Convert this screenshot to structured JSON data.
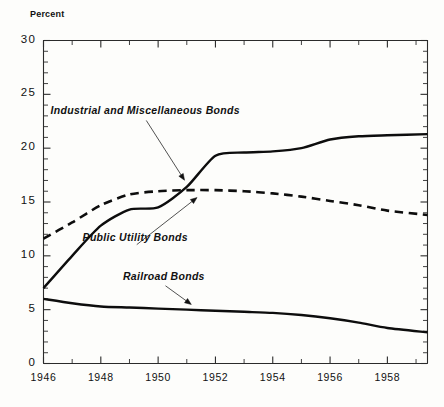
{
  "chart_data": {
    "type": "line",
    "title": "",
    "xlabel": "",
    "ylabel": "Percent",
    "ylim": [
      0,
      30
    ],
    "xlim": [
      1946,
      1959.4
    ],
    "grid": false,
    "legend_position": "inline-annotations",
    "ytick_labels": [
      "0",
      "5",
      "10",
      "15",
      "20",
      "25",
      "30"
    ],
    "ytick_values": [
      0,
      5,
      10,
      15,
      20,
      25,
      30
    ],
    "yminor_step": 1,
    "xtick_labels": [
      "1946",
      "1948",
      "1950",
      "1952",
      "1954",
      "1956",
      "1958"
    ],
    "xtick_values": [
      1946,
      1948,
      1950,
      1952,
      1954,
      1956,
      1958
    ],
    "xminor_step": 1,
    "x": [
      1946,
      1947,
      1948,
      1949,
      1950,
      1951,
      1952,
      1953,
      1954,
      1955,
      1956,
      1957,
      1958,
      1959.4
    ],
    "series": [
      {
        "name": "Industrial and Miscellaneous Bonds",
        "style": "solid",
        "values": [
          7.0,
          10.0,
          12.8,
          14.3,
          14.5,
          16.4,
          19.3,
          19.6,
          19.7,
          20.0,
          20.8,
          21.1,
          21.2,
          21.3
        ]
      },
      {
        "name": "Public Utility Bonds",
        "style": "dashed",
        "values": [
          11.6,
          13.1,
          14.7,
          15.7,
          16.0,
          16.1,
          16.1,
          16.0,
          15.8,
          15.5,
          15.1,
          14.7,
          14.2,
          13.8
        ]
      },
      {
        "name": "Railroad Bonds",
        "style": "solid",
        "values": [
          6.0,
          5.6,
          5.3,
          5.2,
          5.1,
          5.0,
          4.9,
          4.8,
          4.7,
          4.5,
          4.2,
          3.8,
          3.3,
          2.9
        ]
      }
    ],
    "annotations": [
      {
        "text": "Industrial and Miscellaneous Bonds",
        "label_x": 1949.55,
        "label_y": 23.1,
        "arrow_to_x": 1950.95,
        "arrow_to_y": 16.9
      },
      {
        "text": "Public Utility Bonds",
        "label_x": 1949.2,
        "label_y": 11.3,
        "arrow_to_x": 1951.4,
        "arrow_to_y": 15.5
      },
      {
        "text": "Railroad Bonds",
        "label_x": 1950.2,
        "label_y": 7.7,
        "arrow_to_x": 1951.2,
        "arrow_to_y": 5.4
      }
    ]
  }
}
